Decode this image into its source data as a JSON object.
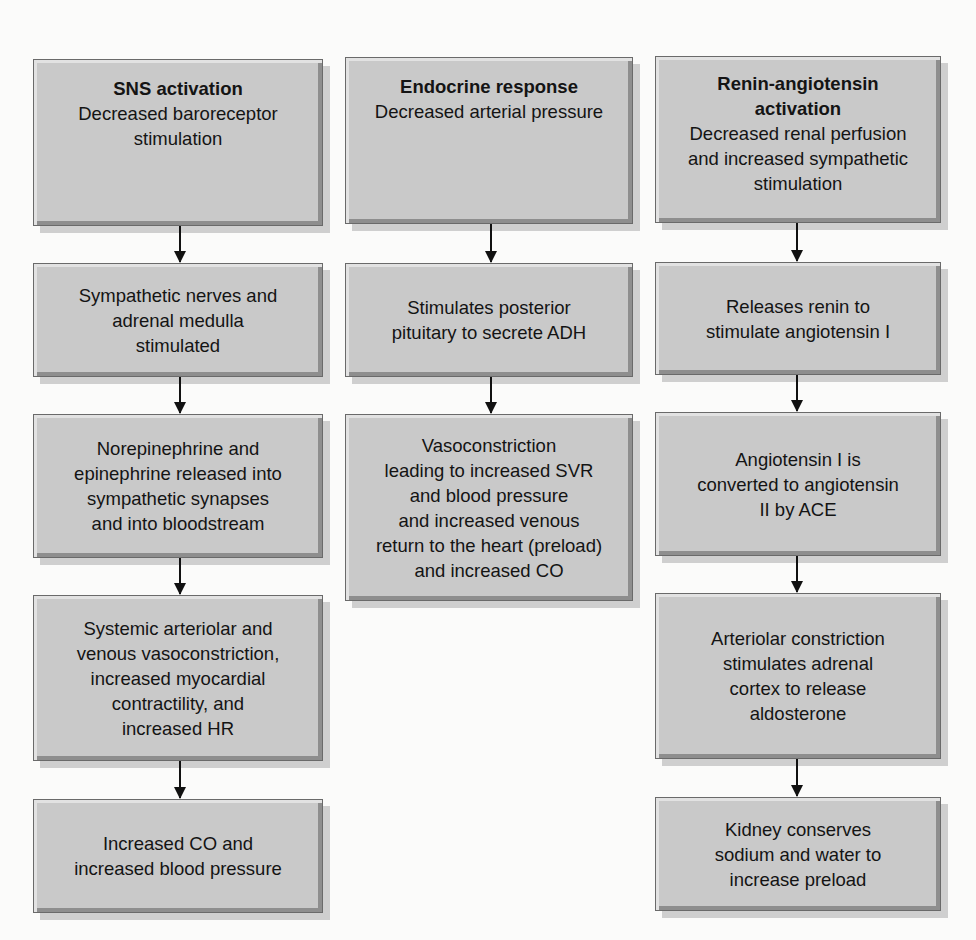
{
  "columns": [
    {
      "name": "sns",
      "boxes": [
        {
          "title": "SNS activation",
          "lines": [
            "Decreased baroreceptor",
            "stimulation"
          ]
        },
        {
          "lines": [
            "Sympathetic nerves and",
            "adrenal medulla",
            "stimulated"
          ]
        },
        {
          "lines": [
            "Norepinephrine and",
            "epinephrine released into",
            "sympathetic synapses",
            "and into bloodstream"
          ]
        },
        {
          "lines": [
            "Systemic arteriolar and",
            "venous vasoconstriction,",
            "increased myocardial",
            "contractility, and",
            "increased HR"
          ]
        },
        {
          "lines": [
            "Increased CO and",
            "increased blood pressure"
          ]
        }
      ]
    },
    {
      "name": "endocrine",
      "boxes": [
        {
          "title": "Endocrine response",
          "lines": [
            "Decreased arterial pressure"
          ]
        },
        {
          "lines": [
            "Stimulates posterior",
            "pituitary to secrete ADH"
          ]
        },
        {
          "lines": [
            "Vasoconstriction",
            "leading to increased SVR",
            "and blood pressure",
            "and increased venous",
            "return to the heart (preload)",
            "and increased CO"
          ]
        }
      ]
    },
    {
      "name": "renin-angiotensin",
      "boxes": [
        {
          "title_lines": [
            "Renin-angiotensin",
            "activation"
          ],
          "lines": [
            "Decreased renal perfusion",
            "and increased sympathetic",
            "stimulation"
          ]
        },
        {
          "lines": [
            "Releases renin to",
            "stimulate angiotensin I"
          ]
        },
        {
          "lines": [
            "Angiotensin I is",
            "converted to angiotensin",
            "II by ACE"
          ]
        },
        {
          "lines": [
            "Arteriolar constriction",
            "stimulates adrenal",
            "cortex to release",
            "aldosterone"
          ]
        },
        {
          "lines": [
            "Kidney conserves",
            "sodium and water to",
            "increase preload"
          ]
        }
      ]
    }
  ]
}
